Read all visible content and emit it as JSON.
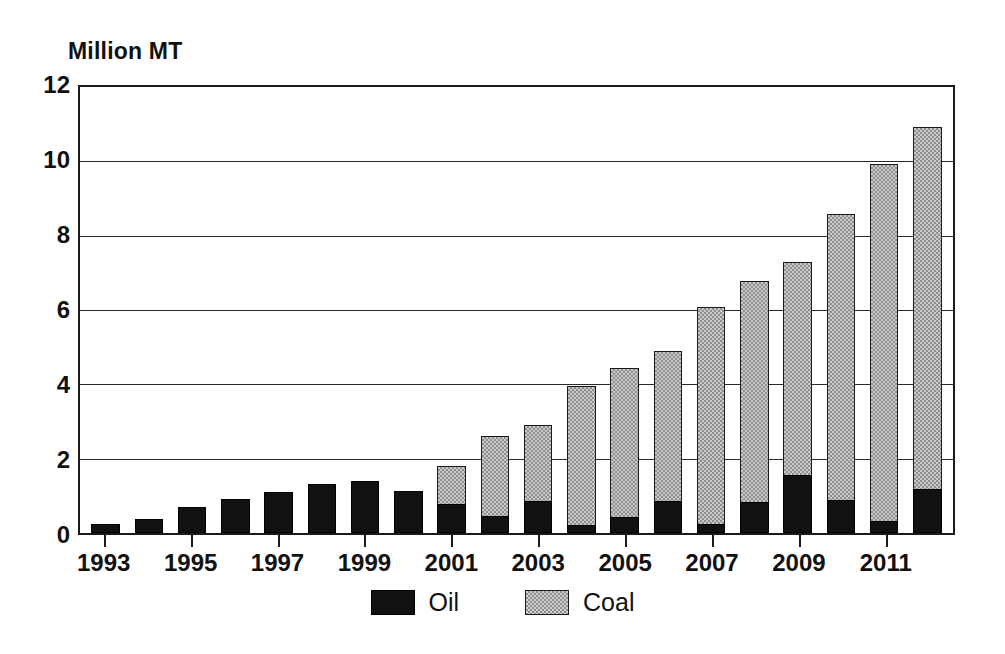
{
  "chart_data": {
    "type": "bar",
    "stacked": true,
    "title": "",
    "subtitle": "",
    "xlabel": "",
    "ylabel": "Million MT",
    "ylim": [
      0,
      12
    ],
    "ytick_values": [
      0,
      2,
      4,
      6,
      8,
      10,
      12
    ],
    "ytick_labels": [
      "0",
      "2",
      "4",
      "6",
      "8",
      "10",
      "12"
    ],
    "grid": "horizontal",
    "legend_position": "bottom-center",
    "categories": [
      "1993",
      "1994",
      "1995",
      "1996",
      "1997",
      "1998",
      "1999",
      "2000",
      "2001",
      "2002",
      "2003",
      "2004",
      "2005",
      "2006",
      "2007",
      "2008",
      "2009",
      "2010",
      "2011",
      "2012"
    ],
    "xtick_labels": [
      "1993",
      "1995",
      "1997",
      "1999",
      "2001",
      "2003",
      "2005",
      "2007",
      "2009",
      "2011"
    ],
    "xtick_category_indices": [
      0,
      2,
      4,
      6,
      8,
      10,
      12,
      14,
      16,
      18
    ],
    "series": [
      {
        "name": "Oil",
        "color": "#111111",
        "values": [
          0.25,
          0.37,
          0.7,
          0.9,
          1.1,
          1.3,
          1.4,
          1.12,
          0.78,
          0.45,
          0.85,
          0.22,
          0.42,
          0.85,
          0.24,
          0.82,
          1.55,
          0.88,
          0.33,
          1.18
        ]
      },
      {
        "name": "Coal",
        "color": "#c9c9c9",
        "values": [
          0.0,
          0.0,
          0.0,
          0.0,
          0.0,
          0.0,
          0.0,
          0.0,
          1.02,
          2.15,
          2.02,
          3.7,
          3.98,
          4.0,
          5.78,
          5.9,
          5.68,
          7.63,
          9.5,
          9.64
        ]
      }
    ],
    "totals": [
      0.25,
      0.37,
      0.7,
      0.9,
      1.1,
      1.3,
      1.4,
      1.12,
      1.8,
      2.6,
      2.87,
      3.92,
      4.4,
      4.85,
      6.02,
      6.72,
      7.23,
      8.51,
      9.83,
      10.82
    ]
  },
  "legend": {
    "entries": [
      {
        "label": "Oil"
      },
      {
        "label": "Coal"
      }
    ]
  }
}
